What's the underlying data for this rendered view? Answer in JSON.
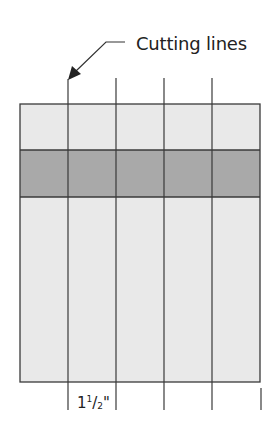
{
  "diagram": {
    "callout": {
      "label": "Cutting lines",
      "icon": "arrow-pointer-icon"
    },
    "fabric": {
      "bands": [
        {
          "name": "top-light-band",
          "color": "#e9e9e9"
        },
        {
          "name": "middle-dark-band",
          "color": "#a9a9a9"
        },
        {
          "name": "bottom-light-band",
          "color": "#e9e9e9"
        }
      ],
      "outline_color": "#3a3a3a",
      "cutting_line_count": 4,
      "segments": 5
    },
    "dimension": {
      "whole": "1",
      "numerator": "1",
      "slash": "/",
      "denominator": "2",
      "unit": "\""
    },
    "colors": {
      "line": "#3a3a3a",
      "light_fabric": "#e9e9e9",
      "dark_fabric": "#a9a9a9",
      "text": "#222222"
    }
  }
}
